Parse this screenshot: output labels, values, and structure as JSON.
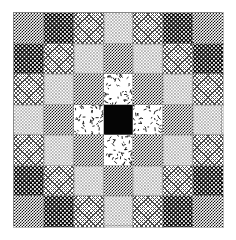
{
  "figure": {
    "width_px": 236,
    "height_px": 240,
    "background_color": "#ffffff",
    "frame": {
      "border_color": "#8c8c8c",
      "left_px": 13,
      "top_px": 12,
      "width_px": 209,
      "height_px": 214
    },
    "grid": {
      "rows": 7,
      "columns": 7,
      "cell_border_color": "#828282"
    }
  },
  "legend": {
    "textures": [
      {
        "key": "darkcheck",
        "label": "Dark checkerboard",
        "color": "#111111"
      },
      {
        "key": "dots",
        "label": "Dense speckle dots",
        "color": "#0a0a0a"
      },
      {
        "key": "lightdots",
        "label": "Light fine dots",
        "color": "#6e6e6e"
      },
      {
        "key": "hatch",
        "label": "Gray diagonal crosshatch",
        "color": "#4a4a4a"
      },
      {
        "key": "confetti",
        "label": "Scattered dashes",
        "color": "#000000"
      },
      {
        "key": "solid",
        "label": "Solid black",
        "color": "#050505"
      }
    ]
  },
  "chart_data": {
    "type": "heatmap",
    "xlabel": "",
    "ylabel": "",
    "grid": true,
    "legend_position": "none",
    "categories": [
      "c1",
      "c2",
      "c3",
      "c4",
      "c5",
      "c6",
      "c7"
    ],
    "row_labels": [
      "r1",
      "r2",
      "r3",
      "r4",
      "r5",
      "r6",
      "r7"
    ],
    "texture_keys": [
      [
        "darkcheck",
        "dots",
        "hatch",
        "lightdots",
        "hatch",
        "dots",
        "darkcheck"
      ],
      [
        "dots",
        "hatch",
        "lightdots",
        "darkcheck",
        "lightdots",
        "hatch",
        "dots"
      ],
      [
        "hatch",
        "lightdots",
        "darkcheck",
        "confetti",
        "darkcheck",
        "lightdots",
        "hatch"
      ],
      [
        "lightdots",
        "darkcheck",
        "confetti",
        "solid",
        "confetti",
        "darkcheck",
        "lightdots"
      ],
      [
        "hatch",
        "lightdots",
        "darkcheck",
        "confetti",
        "darkcheck",
        "lightdots",
        "hatch"
      ],
      [
        "dots",
        "hatch",
        "lightdots",
        "darkcheck",
        "lightdots",
        "hatch",
        "dots"
      ],
      [
        "darkcheck",
        "dots",
        "hatch",
        "lightdots",
        "hatch",
        "dots",
        "darkcheck"
      ]
    ],
    "values": [
      [
        5,
        4,
        3,
        2,
        3,
        4,
        5
      ],
      [
        4,
        3,
        2,
        5,
        2,
        3,
        4
      ],
      [
        3,
        2,
        5,
        1,
        5,
        2,
        3
      ],
      [
        2,
        5,
        1,
        6,
        1,
        5,
        2
      ],
      [
        3,
        2,
        5,
        1,
        5,
        2,
        3
      ],
      [
        4,
        3,
        2,
        5,
        2,
        3,
        4
      ],
      [
        5,
        4,
        3,
        2,
        3,
        4,
        5
      ]
    ],
    "value_scale": {
      "1": "confetti",
      "2": "lightdots",
      "3": "hatch",
      "4": "dots",
      "5": "darkcheck",
      "6": "solid"
    }
  }
}
